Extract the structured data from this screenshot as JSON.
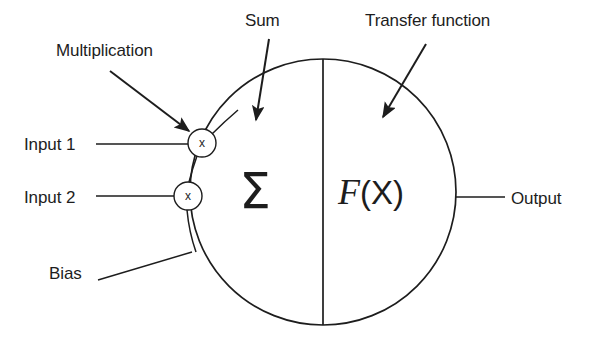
{
  "diagram": {
    "background_color": "#ffffff",
    "stroke_color": "#1d1d1d",
    "labels": {
      "multiplication": "Multiplication",
      "sum": "Sum",
      "transfer_function": "Transfer function",
      "input1": "Input 1",
      "input2": "Input 2",
      "bias": "Bias",
      "output": "Output"
    },
    "nodes": {
      "multiply_node_1_glyph": "x",
      "multiply_node_2_glyph": "x",
      "sum_symbol": "Σ",
      "transfer_symbol_f": "F",
      "transfer_symbol_arg": "(X)"
    },
    "geometry": {
      "body_circle": {
        "cx": 323,
        "cy": 192,
        "r": 133
      },
      "divider_x": 323,
      "multiply_node_1": {
        "cx": 202,
        "cy": 143,
        "r": 14
      },
      "multiply_node_2": {
        "cx": 188,
        "cy": 196,
        "r": 14
      },
      "output_line": {
        "x1": 456,
        "y1": 197,
        "x2": 505,
        "y2": 197
      }
    }
  }
}
